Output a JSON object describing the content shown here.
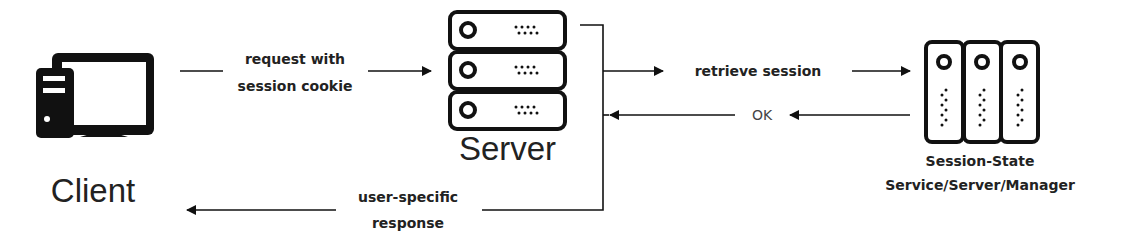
{
  "nodes": {
    "client": {
      "label": "Client",
      "icon": "desktop-computer-icon"
    },
    "server": {
      "label": "Server",
      "icon": "server-rack-icon"
    },
    "session_state": {
      "label_line1": "Session-State",
      "label_line2": "Service/Server/Manager",
      "icon": "server-tower-cluster-icon"
    }
  },
  "edges": {
    "request": {
      "line1": "request with",
      "line2": "session cookie",
      "from": "Client",
      "to": "Server"
    },
    "retrieve": {
      "label": "retrieve session",
      "from": "Server",
      "to": "Session-State Service/Server/Manager"
    },
    "ok": {
      "label": "OK",
      "from": "Session-State Service/Server/Manager",
      "to": "Server"
    },
    "response": {
      "line1": "user-specific",
      "line2": "response",
      "from": "Server",
      "to": "Client"
    }
  },
  "colors": {
    "stroke": "#111111",
    "text": "#222222",
    "background": "#ffffff"
  }
}
